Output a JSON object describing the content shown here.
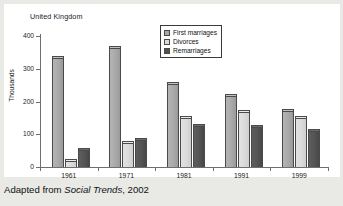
{
  "panel": {
    "title": "United Kingdom"
  },
  "caption": {
    "prefix": "Adapted from ",
    "source": "Social Trends",
    "suffix": ", 2002"
  },
  "legend": {
    "position": "top-center",
    "items": [
      {
        "label": "First marriages",
        "color": "#a9a9a9"
      },
      {
        "label": "Divorces",
        "color": "#dcdcdc"
      },
      {
        "label": "Remarriages",
        "color": "#525252"
      }
    ]
  },
  "axes": {
    "y_title": "Thousands",
    "y_ticks": [
      "400",
      "300",
      "200",
      "100",
      "0"
    ],
    "x_ticks": [
      "1961",
      "1971",
      "1981",
      "1991",
      "1999"
    ]
  },
  "chart_data": {
    "type": "bar",
    "title": "United Kingdom",
    "subtitle": "",
    "xlabel": "",
    "ylabel": "Thousands",
    "ylim": [
      0,
      400
    ],
    "ytick_interval": 100,
    "grid": false,
    "legend_position": "top-center",
    "categories": [
      "1961",
      "1971",
      "1981",
      "1991",
      "1999"
    ],
    "series": [
      {
        "name": "First marriages",
        "color": "#a9a9a9",
        "values": [
          340,
          370,
          260,
          222,
          178
        ]
      },
      {
        "name": "Divorces",
        "color": "#dcdcdc",
        "values": [
          25,
          78,
          155,
          175,
          155
        ]
      },
      {
        "name": "Remarriages",
        "color": "#525252",
        "values": [
          57,
          90,
          132,
          128,
          117
        ]
      }
    ],
    "annotations": [
      "Adapted from Social Trends, 2002"
    ]
  }
}
